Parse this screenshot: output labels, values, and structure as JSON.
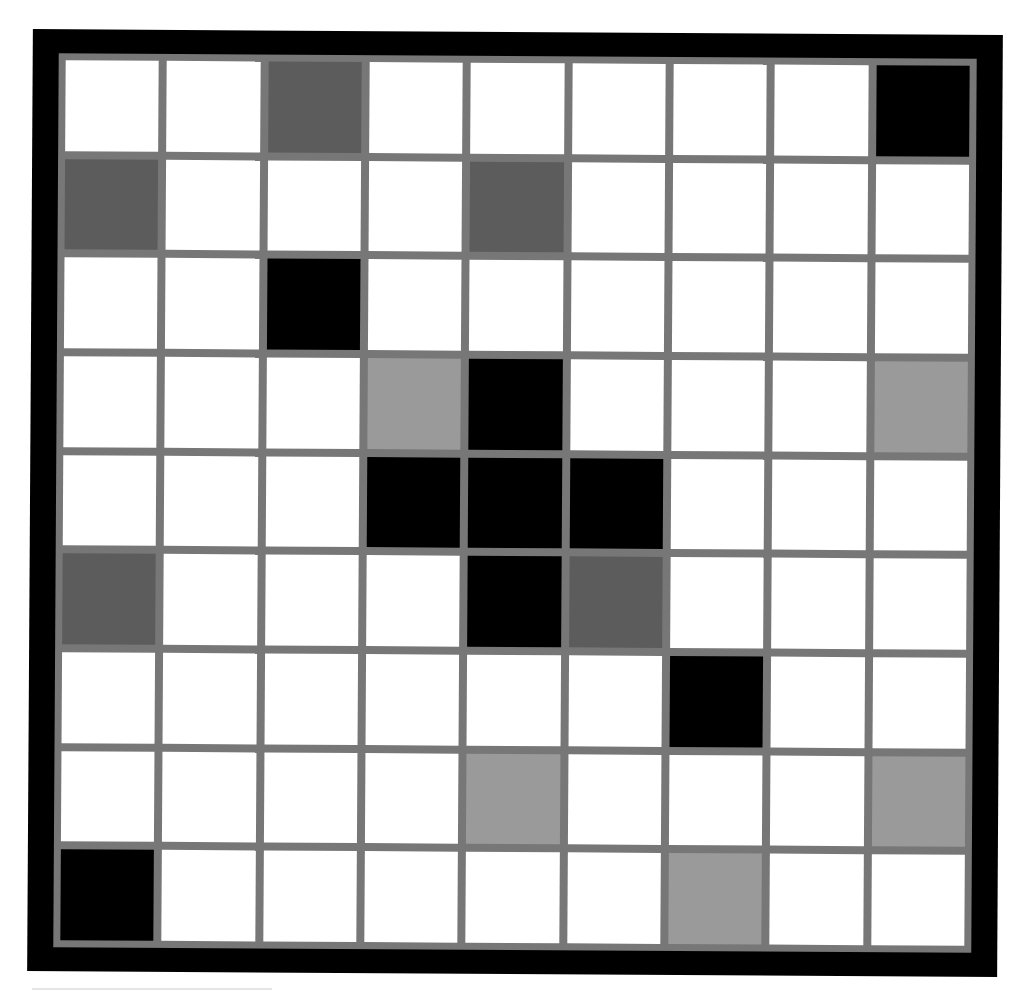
{
  "puzzle": {
    "rows": 9,
    "cols": 9,
    "palette": {
      "W": "#ffffff",
      "K": "#000000",
      "D": "#5c5c5c",
      "L": "#9a9a9a"
    },
    "palette_names": {
      "W": "white",
      "K": "black",
      "D": "dark-gray",
      "L": "light-gray"
    },
    "frame_color": "#000000",
    "grid_line_color": "#777777",
    "grid": [
      [
        "W",
        "W",
        "D",
        "W",
        "W",
        "W",
        "W",
        "W",
        "K"
      ],
      [
        "D",
        "W",
        "W",
        "W",
        "D",
        "W",
        "W",
        "W",
        "W"
      ],
      [
        "W",
        "W",
        "K",
        "W",
        "W",
        "W",
        "W",
        "W",
        "W"
      ],
      [
        "W",
        "W",
        "W",
        "L",
        "K",
        "W",
        "W",
        "W",
        "L"
      ],
      [
        "W",
        "W",
        "W",
        "K",
        "K",
        "K",
        "W",
        "W",
        "W"
      ],
      [
        "D",
        "W",
        "W",
        "W",
        "K",
        "D",
        "W",
        "W",
        "W"
      ],
      [
        "W",
        "W",
        "W",
        "W",
        "W",
        "W",
        "K",
        "W",
        "W"
      ],
      [
        "W",
        "W",
        "W",
        "W",
        "L",
        "W",
        "W",
        "W",
        "L"
      ],
      [
        "K",
        "W",
        "W",
        "W",
        "W",
        "W",
        "L",
        "W",
        "W"
      ]
    ]
  }
}
